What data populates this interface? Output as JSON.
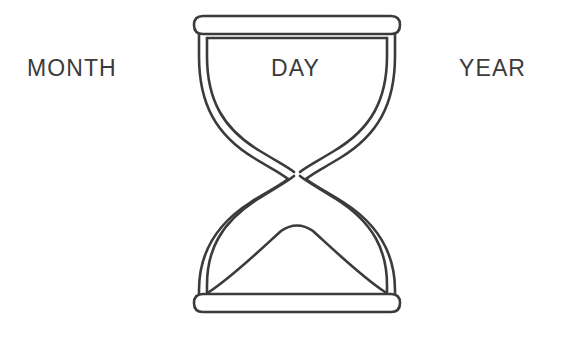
{
  "canvas": {
    "width": 574,
    "height": 339,
    "background_color": "#ffffff"
  },
  "diagram": {
    "kind": "hourglass-line-drawing",
    "stroke_color": "#3b3b3b",
    "stroke_width": 2.6,
    "fill": "none",
    "center_x": 297,
    "top_y": 15,
    "bottom_y": 312,
    "waist_y": 170,
    "parts": [
      "top-cap",
      "upper-chamber-outer-wall",
      "upper-chamber-inner-wall",
      "waist",
      "lower-chamber-outer-wall",
      "lower-chamber-inner-wall",
      "sand-mound",
      "bottom-cap"
    ]
  },
  "labels": {
    "month": "MONTH",
    "day": "DAY",
    "year": "YEAR"
  },
  "text_color": "#3b3b3b"
}
